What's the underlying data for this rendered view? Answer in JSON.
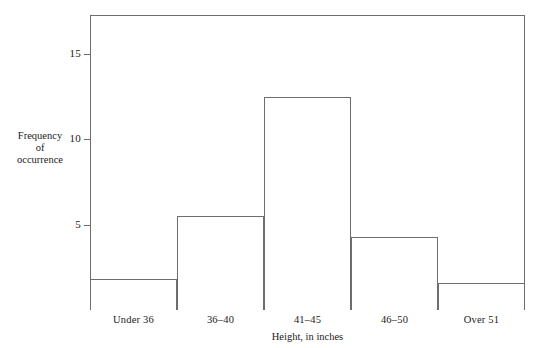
{
  "chart_data": {
    "type": "bar",
    "title": "",
    "subtitle": "",
    "categories": [
      "Under 36",
      "36–40",
      "41–45",
      "46–50",
      "Over 51"
    ],
    "values": [
      1.8,
      5.5,
      12.5,
      4.3,
      1.6
    ],
    "xlabel": "Height, in inches",
    "ylabel": "Frequency of occurrence",
    "ylabel_lines": [
      "Frequency",
      "of",
      "occurrence"
    ],
    "ylim": [
      0,
      17.3
    ],
    "yticks": [
      5,
      10,
      15
    ],
    "ytick_labels": [
      "5",
      "10",
      "15"
    ],
    "grid": false,
    "legend": false,
    "legend_position": "none",
    "style": {
      "bar_fill": "#ffffff",
      "bar_edge": "#6d6d6d",
      "frame_color": "#6d6d6d",
      "text_color": "#1a1a1a",
      "background": "#ffffff"
    }
  }
}
